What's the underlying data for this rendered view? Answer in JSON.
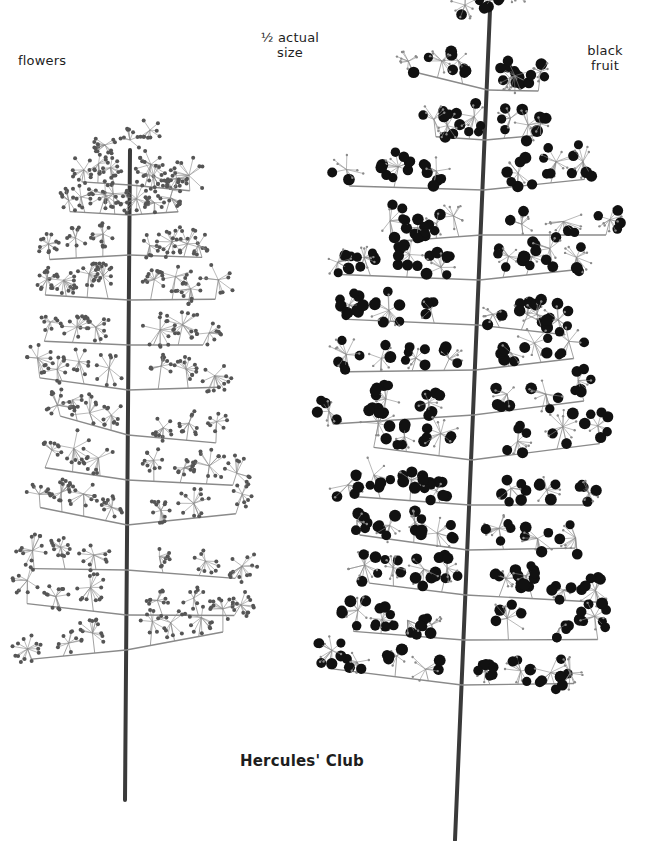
{
  "labels": {
    "left": "flowers",
    "scale_line1": "½ actual",
    "scale_line2": "size",
    "right_line1": "black",
    "right_line2": "fruit",
    "title": "Hercules' Club"
  },
  "colors": {
    "background": "#ffffff",
    "stem": "#3a3a3a",
    "flower": "#555555",
    "fruit": "#111111",
    "twig": "#8a8a8a"
  },
  "specimens": [
    {
      "name": "flowering-panicle",
      "stem": {
        "x_top": 130,
        "y_top": 180,
        "x_bottom": 125,
        "y_bottom": 800
      },
      "branch_levels": [
        185,
        215,
        255,
        300,
        345,
        390,
        435,
        480,
        525,
        570,
        615,
        650
      ],
      "spread_left": 110,
      "spread_right": 120,
      "cluster_type": "flower"
    },
    {
      "name": "fruiting-panicle",
      "stem": {
        "x_top": 490,
        "y_top": 40,
        "x_bottom": 455,
        "y_bottom": 840
      },
      "branch_levels": [
        90,
        140,
        190,
        235,
        280,
        325,
        370,
        415,
        460,
        505,
        550,
        595,
        640,
        685
      ],
      "spread_left": 150,
      "spread_right": 140,
      "cluster_type": "fruit"
    }
  ]
}
